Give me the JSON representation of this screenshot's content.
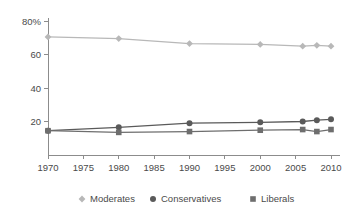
{
  "chart_data": {
    "type": "line",
    "title": "",
    "subtitle": "",
    "xlabel": "",
    "ylabel": "",
    "x": [
      1970,
      1980,
      1990,
      2000,
      2006,
      2008,
      2010
    ],
    "xlim": [
      1970,
      2010
    ],
    "ylim": [
      0,
      80
    ],
    "grid": false,
    "legend_position": "bottom",
    "x_tick_labels": [
      "1970",
      "1975",
      "1980",
      "1985",
      "1990",
      "1995",
      "2000",
      "2005",
      "2010"
    ],
    "x_tick_values": [
      1970,
      1975,
      1980,
      1985,
      1990,
      1995,
      2000,
      2005,
      2010
    ],
    "y_tick_labels": [
      "80%",
      "60",
      "40",
      "20"
    ],
    "y_tick_values": [
      80,
      60,
      40,
      20
    ],
    "series": [
      {
        "name": "Moderates",
        "marker": "diamond",
        "color": "#b8b8b8",
        "values": [
          70.5,
          69.5,
          66.5,
          66,
          65,
          65.5,
          65
        ]
      },
      {
        "name": "Conservatives",
        "marker": "circle",
        "color": "#5a5a5a",
        "values": [
          14.5,
          16.5,
          19,
          19.5,
          20,
          20.8,
          21.3
        ]
      },
      {
        "name": "Liberals",
        "marker": "square",
        "color": "#6e6e6e",
        "values": [
          14.5,
          13.5,
          14,
          14.8,
          15.2,
          14,
          15.2
        ]
      }
    ]
  },
  "legend": {
    "items": [
      {
        "label": "Moderates",
        "marker": "diamond",
        "color": "#b8b8b8"
      },
      {
        "label": "Conservatives",
        "marker": "circle",
        "color": "#5a5a5a"
      },
      {
        "label": "Liberals",
        "marker": "square",
        "color": "#6e6e6e"
      }
    ]
  },
  "axes": {
    "axis_color": "#8c8c8c",
    "label_color": "#4a4a4a"
  }
}
